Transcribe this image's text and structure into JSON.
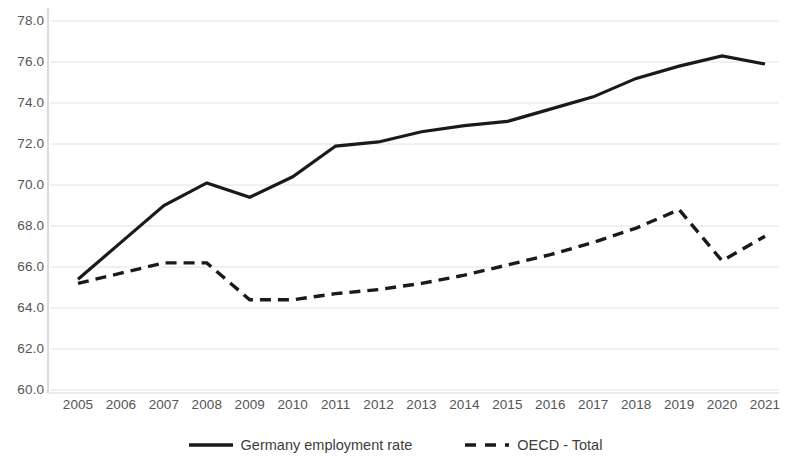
{
  "chart_data": {
    "type": "line",
    "title": "",
    "subtitle": "",
    "xlabel": "",
    "ylabel": "",
    "categories": [
      "2005",
      "2006",
      "2007",
      "2008",
      "2009",
      "2010",
      "2011",
      "2012",
      "2013",
      "2014",
      "2015",
      "2016",
      "2017",
      "2018",
      "2019",
      "2020",
      "2021"
    ],
    "x": [
      2005,
      2006,
      2007,
      2008,
      2009,
      2010,
      2011,
      2012,
      2013,
      2014,
      2015,
      2016,
      2017,
      2018,
      2019,
      2020,
      2021
    ],
    "ylim": [
      60.0,
      78.0
    ],
    "y_ticks": [
      60.0,
      62.0,
      64.0,
      66.0,
      68.0,
      70.0,
      72.0,
      74.0,
      76.0,
      78.0
    ],
    "y_tick_labels": [
      "60.0",
      "62.0",
      "64.0",
      "66.0",
      "68.0",
      "70.0",
      "72.0",
      "74.0",
      "76.0",
      "78.0"
    ],
    "grid": true,
    "grid_axis": "y",
    "legend_position": "bottom",
    "series": [
      {
        "name": "Germany employment rate",
        "style": "solid",
        "color": "#1a1a1a",
        "values": [
          65.4,
          67.2,
          69.0,
          70.1,
          69.4,
          70.4,
          71.9,
          72.1,
          72.6,
          72.9,
          73.1,
          73.7,
          74.3,
          75.2,
          75.8,
          76.3,
          75.9
        ]
      },
      {
        "name": "OECD - Total",
        "style": "dashed",
        "color": "#1a1a1a",
        "values": [
          65.2,
          65.7,
          66.2,
          66.2,
          64.4,
          64.4,
          64.7,
          64.9,
          65.2,
          65.6,
          66.1,
          66.6,
          67.2,
          67.9,
          68.8,
          66.3,
          67.5
        ]
      }
    ]
  },
  "legend": {
    "entries": [
      {
        "label": "Germany employment rate",
        "style": "solid"
      },
      {
        "label": "OECD - Total",
        "style": "dashed"
      }
    ]
  }
}
